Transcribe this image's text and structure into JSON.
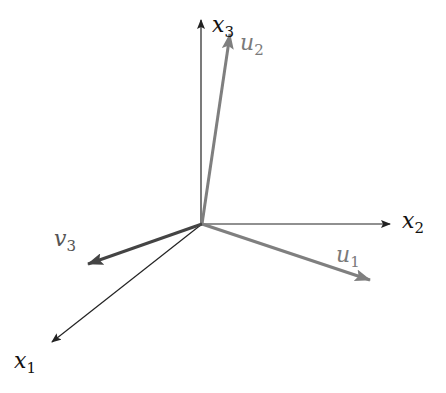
{
  "diagram": {
    "type": "3d-coordinate-axes-with-vectors",
    "origin": [
      202,
      224
    ],
    "axes": [
      {
        "id": "x1",
        "symbol": "x",
        "subscript": "1",
        "tip": [
          52,
          342
        ],
        "color": "#222222",
        "label_pos": [
          14,
          352
        ]
      },
      {
        "id": "x2",
        "symbol": "x",
        "subscript": "2",
        "tip": [
          390,
          224
        ],
        "color": "#222222",
        "label_pos": [
          402,
          210
        ]
      },
      {
        "id": "x3",
        "symbol": "x",
        "subscript": "3",
        "tip": [
          201,
          20
        ],
        "color": "#222222",
        "label_pos": [
          212,
          16
        ]
      }
    ],
    "vectors": [
      {
        "id": "u1",
        "symbol": "u",
        "subscript": "1",
        "tip": [
          370,
          280
        ],
        "color": "#7f7f7f",
        "label_pos": [
          336,
          246
        ]
      },
      {
        "id": "u2",
        "symbol": "u",
        "subscript": "2",
        "tip": [
          230,
          34
        ],
        "color": "#7f7f7f",
        "label_pos": [
          240,
          34
        ]
      },
      {
        "id": "v3",
        "symbol": "v",
        "subscript": "3",
        "tip": [
          88,
          264
        ],
        "color": "#444444",
        "label_pos": [
          54,
          230
        ]
      }
    ]
  }
}
